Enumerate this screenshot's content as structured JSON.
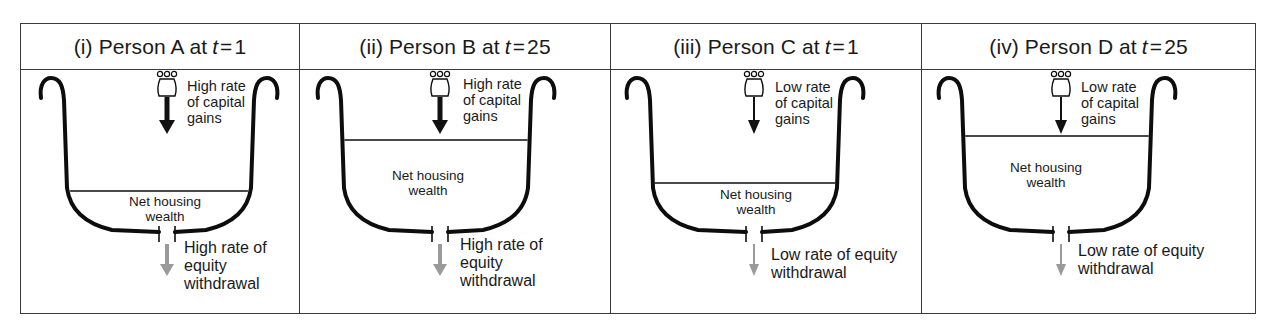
{
  "figure": {
    "panels": [
      {
        "id": "i",
        "numeral": "(i)",
        "person": "Person A at",
        "t_var": "t",
        "t_eq": "=",
        "t_value": "1",
        "capital_gains_rate": "high",
        "capital_gains_label": [
          "High rate",
          "of capital",
          "gains"
        ],
        "wealth_label": [
          "Net housing",
          "wealth"
        ],
        "withdrawal_rate": "high",
        "withdrawal_label": [
          "High rate of",
          "equity",
          "withdrawal"
        ],
        "wealth_level_y": 121
      },
      {
        "id": "ii",
        "numeral": "(ii)",
        "person": "Person B at",
        "t_var": "t",
        "t_eq": "=",
        "t_value": "25",
        "capital_gains_rate": "high",
        "capital_gains_label": [
          "High rate",
          "of capital",
          "gains"
        ],
        "wealth_label": [
          "Net housing",
          "wealth"
        ],
        "withdrawal_rate": "high",
        "withdrawal_label": [
          "High rate of",
          "equity",
          "withdrawal"
        ],
        "wealth_level_y": 70
      },
      {
        "id": "iii",
        "numeral": "(iii)",
        "person": "Person C at",
        "t_var": "t",
        "t_eq": "=",
        "t_value": "1",
        "capital_gains_rate": "low",
        "capital_gains_label": [
          "Low rate",
          "of capital",
          "gains"
        ],
        "wealth_label": [
          "Net housing",
          "wealth"
        ],
        "withdrawal_rate": "low",
        "withdrawal_label": [
          "Low rate of equity",
          "withdrawal"
        ],
        "wealth_level_y": 113
      },
      {
        "id": "iv",
        "numeral": "(iv)",
        "person": "Person D at",
        "t_var": "t",
        "t_eq": "=",
        "t_value": "25",
        "capital_gains_rate": "low",
        "capital_gains_label": [
          "Low rate",
          "of capital",
          "gains"
        ],
        "wealth_label": [
          "Net housing",
          "wealth"
        ],
        "withdrawal_rate": "low",
        "withdrawal_label": [
          "Low rate of equity",
          "withdrawal"
        ],
        "wealth_level_y": 66
      }
    ],
    "colors": {
      "outline": "#3a3a3a",
      "bucket": "#0d0d0d",
      "inflow_arrow": "#111111",
      "outflow_arrow": "#9a9a9a"
    }
  }
}
